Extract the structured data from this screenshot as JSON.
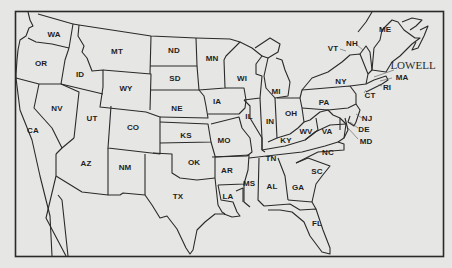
{
  "map": {
    "title": "United States map with state abbreviations",
    "city_label": "LOWELL",
    "colors": {
      "background": "#e6e6e4",
      "lines": "#2a2a2a",
      "text": "#1e1e1e"
    },
    "states": [
      {
        "abbr": "WA",
        "x": 54,
        "y": 34
      },
      {
        "abbr": "OR",
        "x": 41,
        "y": 63
      },
      {
        "abbr": "ID",
        "x": 80,
        "y": 74
      },
      {
        "abbr": "MT",
        "x": 117,
        "y": 51
      },
      {
        "abbr": "WY",
        "x": 126,
        "y": 88
      },
      {
        "abbr": "ND",
        "x": 174,
        "y": 50
      },
      {
        "abbr": "SD",
        "x": 175,
        "y": 78
      },
      {
        "abbr": "NE",
        "x": 177,
        "y": 108
      },
      {
        "abbr": "MN",
        "x": 212,
        "y": 58
      },
      {
        "abbr": "IA",
        "x": 217,
        "y": 101
      },
      {
        "abbr": "NV",
        "x": 57,
        "y": 108
      },
      {
        "abbr": "UT",
        "x": 92,
        "y": 118
      },
      {
        "abbr": "CO",
        "x": 133,
        "y": 127
      },
      {
        "abbr": "KS",
        "x": 186,
        "y": 135
      },
      {
        "abbr": "CA",
        "x": 33,
        "y": 130
      },
      {
        "abbr": "AZ",
        "x": 86,
        "y": 163
      },
      {
        "abbr": "NM",
        "x": 125,
        "y": 167
      },
      {
        "abbr": "OK",
        "x": 194,
        "y": 162
      },
      {
        "abbr": "TX",
        "x": 178,
        "y": 196
      },
      {
        "abbr": "MO",
        "x": 224,
        "y": 140
      },
      {
        "abbr": "AR",
        "x": 227,
        "y": 170
      },
      {
        "abbr": "LA",
        "x": 228,
        "y": 196
      },
      {
        "abbr": "WI",
        "x": 242,
        "y": 78
      },
      {
        "abbr": "MI",
        "x": 276,
        "y": 91
      },
      {
        "abbr": "IL",
        "x": 249,
        "y": 116
      },
      {
        "abbr": "IN",
        "x": 270,
        "y": 121
      },
      {
        "abbr": "OH",
        "x": 291,
        "y": 113
      },
      {
        "abbr": "KY",
        "x": 286,
        "y": 140
      },
      {
        "abbr": "TN",
        "x": 271,
        "y": 158
      },
      {
        "abbr": "MS",
        "x": 249,
        "y": 183
      },
      {
        "abbr": "AL",
        "x": 272,
        "y": 186
      },
      {
        "abbr": "GA",
        "x": 298,
        "y": 187
      },
      {
        "abbr": "FL",
        "x": 317,
        "y": 223
      },
      {
        "abbr": "SC",
        "x": 317,
        "y": 171
      },
      {
        "abbr": "NC",
        "x": 328,
        "y": 152
      },
      {
        "abbr": "VA",
        "x": 327,
        "y": 131
      },
      {
        "abbr": "WV",
        "x": 306,
        "y": 131
      },
      {
        "abbr": "PA",
        "x": 324,
        "y": 102
      },
      {
        "abbr": "NY",
        "x": 341,
        "y": 81
      },
      {
        "abbr": "VT",
        "x": 333,
        "y": 48
      },
      {
        "abbr": "NH",
        "x": 352,
        "y": 43
      },
      {
        "abbr": "ME",
        "x": 385,
        "y": 29
      },
      {
        "abbr": "MA",
        "x": 402,
        "y": 77
      },
      {
        "abbr": "RI",
        "x": 387,
        "y": 87
      },
      {
        "abbr": "CT",
        "x": 370,
        "y": 95
      },
      {
        "abbr": "NJ",
        "x": 367,
        "y": 118
      },
      {
        "abbr": "DE",
        "x": 364,
        "y": 129
      },
      {
        "abbr": "MD",
        "x": 366,
        "y": 141
      }
    ],
    "lowell_label_pos": {
      "x": 413,
      "y": 65
    }
  }
}
